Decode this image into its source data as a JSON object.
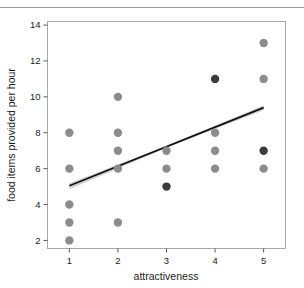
{
  "figure": {
    "top_rule": "horizontal-rule"
  },
  "chart_data": {
    "type": "scatter",
    "title": "",
    "xlabel": "attractiveness",
    "ylabel": "food items provided per hour",
    "xlim": [
      0.55,
      5.45
    ],
    "ylim": [
      1.55,
      14.2
    ],
    "xticks": [
      1,
      2,
      3,
      4,
      5
    ],
    "xtick_labels": [
      "1",
      "2",
      "3",
      "4",
      "5"
    ],
    "yticks": [
      2,
      4,
      6,
      8,
      10,
      12,
      14
    ],
    "ytick_labels": [
      "2",
      "4",
      "6",
      "8",
      "10",
      "12",
      "14"
    ],
    "grid": false,
    "legend": "none",
    "marker_colors": {
      "light": "#8c8c8c",
      "dark": "#3b3b3b"
    },
    "points": [
      {
        "x": 1,
        "y": 8,
        "shade": "light"
      },
      {
        "x": 1,
        "y": 6,
        "shade": "light"
      },
      {
        "x": 1,
        "y": 4,
        "shade": "light"
      },
      {
        "x": 1,
        "y": 3,
        "shade": "light"
      },
      {
        "x": 1,
        "y": 2,
        "shade": "light"
      },
      {
        "x": 2,
        "y": 10,
        "shade": "light"
      },
      {
        "x": 2,
        "y": 8,
        "shade": "light"
      },
      {
        "x": 2,
        "y": 7,
        "shade": "light"
      },
      {
        "x": 2,
        "y": 6,
        "shade": "light"
      },
      {
        "x": 2,
        "y": 3,
        "shade": "light"
      },
      {
        "x": 3,
        "y": 7,
        "shade": "light"
      },
      {
        "x": 3,
        "y": 6,
        "shade": "light"
      },
      {
        "x": 3,
        "y": 5,
        "shade": "dark"
      },
      {
        "x": 4,
        "y": 11,
        "shade": "dark"
      },
      {
        "x": 4,
        "y": 8,
        "shade": "light"
      },
      {
        "x": 4,
        "y": 7,
        "shade": "light"
      },
      {
        "x": 4,
        "y": 6,
        "shade": "light"
      },
      {
        "x": 5,
        "y": 13,
        "shade": "light"
      },
      {
        "x": 5,
        "y": 11,
        "shade": "light"
      },
      {
        "x": 5,
        "y": 7,
        "shade": "dark"
      },
      {
        "x": 5,
        "y": 6,
        "shade": "light"
      }
    ],
    "fit_line": {
      "kind": "linear-regression",
      "x_start": 1,
      "y_start": 5.05,
      "x_end": 5,
      "y_end": 9.4,
      "color": "#111111",
      "band_color": "#c9c9c9"
    },
    "box_color": "#a8a8a8",
    "marker_radius_px": 4.2
  }
}
